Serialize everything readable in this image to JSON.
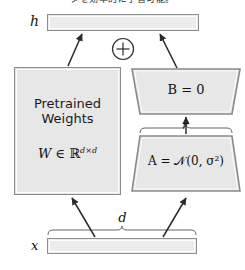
{
  "figure": {
    "type": "lora-architecture-diagram",
    "clipped_header_text": "タを効率的に学習可能。",
    "output_label": "h",
    "input_label": "x",
    "input_dim_label": "d",
    "rank_label": "r",
    "adder_symbol": "+",
    "pretrained_box": {
      "title": "Pretrained\nWeights",
      "formula_prefix": "W",
      "formula_in": " ∈ ",
      "formula_space": "ℝ",
      "formula_superscript": "d×d"
    },
    "lora_up": {
      "name": "B-matrix",
      "label": "B = 0"
    },
    "lora_down": {
      "name": "A-matrix",
      "label": "A = 𝒩(0, σ²)"
    },
    "colors": {
      "box_fill": "#e7e7e7",
      "box_stroke": "#8a8a8a",
      "bar_fill": "#ececec",
      "line": "#2b2b2b",
      "text": "#111111",
      "background": "#ffffff"
    }
  }
}
